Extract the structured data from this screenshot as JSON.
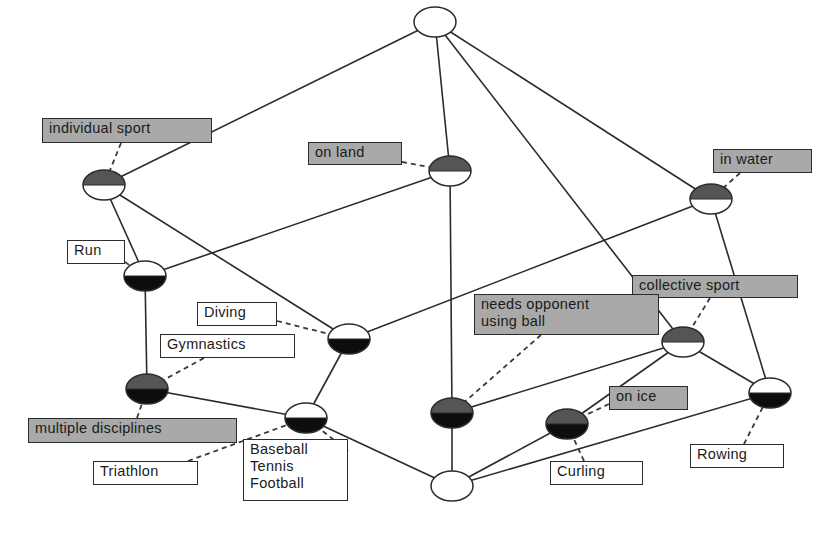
{
  "diagram": {
    "type": "concept-lattice",
    "colors": {
      "background": "#ffffff",
      "edge": "#2b2b2b",
      "attribute_fill": "#555555",
      "object_fill": "#0d0d0d",
      "attribute_label_bg": "#a9a9a9",
      "object_label_bg": "#ffffff"
    },
    "nodes": [
      {
        "id": "top",
        "x": 435,
        "y": 22,
        "top_filled": false,
        "bottom_filled": false
      },
      {
        "id": "individual-sport",
        "x": 104,
        "y": 185,
        "top_filled": true,
        "bottom_filled": false
      },
      {
        "id": "on-land",
        "x": 450,
        "y": 171,
        "top_filled": true,
        "bottom_filled": false
      },
      {
        "id": "in-water",
        "x": 711,
        "y": 199,
        "top_filled": true,
        "bottom_filled": false
      },
      {
        "id": "run",
        "x": 145,
        "y": 276,
        "top_filled": false,
        "bottom_filled": true
      },
      {
        "id": "diving",
        "x": 349,
        "y": 339,
        "top_filled": false,
        "bottom_filled": true
      },
      {
        "id": "multiple-disciplines",
        "x": 147,
        "y": 389,
        "top_filled": true,
        "bottom_filled": true
      },
      {
        "id": "baseball-tennis-football",
        "x": 306,
        "y": 418,
        "top_filled": false,
        "bottom_filled": true
      },
      {
        "id": "needs-opponent",
        "x": 452,
        "y": 413,
        "top_filled": true,
        "bottom_filled": true
      },
      {
        "id": "collective-sport",
        "x": 683,
        "y": 342,
        "top_filled": true,
        "bottom_filled": false
      },
      {
        "id": "on-ice",
        "x": 567,
        "y": 424,
        "top_filled": true,
        "bottom_filled": true
      },
      {
        "id": "rowing",
        "x": 770,
        "y": 393,
        "top_filled": false,
        "bottom_filled": true
      },
      {
        "id": "bottom",
        "x": 452,
        "y": 486,
        "top_filled": false,
        "bottom_filled": false
      }
    ],
    "edges": [
      [
        "top",
        "individual-sport"
      ],
      [
        "top",
        "on-land"
      ],
      [
        "top",
        "in-water"
      ],
      [
        "top",
        "collective-sport"
      ],
      [
        "individual-sport",
        "run"
      ],
      [
        "individual-sport",
        "diving"
      ],
      [
        "on-land",
        "run"
      ],
      [
        "on-land",
        "needs-opponent"
      ],
      [
        "in-water",
        "diving"
      ],
      [
        "in-water",
        "rowing"
      ],
      [
        "run",
        "multiple-disciplines"
      ],
      [
        "diving",
        "baseball-tennis-football"
      ],
      [
        "multiple-disciplines",
        "baseball-tennis-football"
      ],
      [
        "baseball-tennis-football",
        "bottom"
      ],
      [
        "needs-opponent",
        "bottom"
      ],
      [
        "collective-sport",
        "needs-opponent"
      ],
      [
        "collective-sport",
        "on-ice"
      ],
      [
        "collective-sport",
        "rowing"
      ],
      [
        "on-ice",
        "bottom"
      ],
      [
        "rowing",
        "bottom"
      ]
    ],
    "attribute_labels": [
      {
        "id": "lbl-individual-sport",
        "text": "individual sport",
        "x": 42,
        "y": 118,
        "w": 170,
        "h": 25,
        "node": "individual-sport",
        "anchor_x": 121,
        "anchor_y": 143
      },
      {
        "id": "lbl-on-land",
        "text": "on land",
        "x": 308,
        "y": 142,
        "w": 94,
        "h": 23,
        "node": "on-land",
        "anchor_x": 402,
        "anchor_y": 162
      },
      {
        "id": "lbl-in-water",
        "text": "in water",
        "x": 713,
        "y": 149,
        "w": 99,
        "h": 24,
        "node": "in-water",
        "anchor_x": 740,
        "anchor_y": 173
      },
      {
        "id": "lbl-collective-sport",
        "text": "collective sport",
        "x": 632,
        "y": 275,
        "w": 166,
        "h": 23,
        "node": "collective-sport",
        "anchor_x": 710,
        "anchor_y": 298
      },
      {
        "id": "lbl-needs-opponent",
        "text": "needs opponent\nusing ball",
        "x": 474,
        "y": 294,
        "w": 185,
        "h": 41,
        "node": "needs-opponent",
        "anchor_x": 541,
        "anchor_y": 335
      },
      {
        "id": "lbl-multiple-disciplines",
        "text": "multiple disciplines",
        "x": 28,
        "y": 418,
        "w": 209,
        "h": 25,
        "node": "multiple-disciplines",
        "anchor_x": 137,
        "anchor_y": 418
      },
      {
        "id": "lbl-on-ice",
        "text": "on ice",
        "x": 609,
        "y": 386,
        "w": 79,
        "h": 24,
        "node": "on-ice",
        "anchor_x": 609,
        "anchor_y": 404
      }
    ],
    "object_labels": [
      {
        "id": "lbl-run",
        "text": "Run",
        "x": 67,
        "y": 240,
        "w": 58,
        "h": 24,
        "node": "run",
        "anchor_x": 125,
        "anchor_y": 262
      },
      {
        "id": "lbl-diving",
        "text": "Diving",
        "x": 197,
        "y": 302,
        "w": 80,
        "h": 24,
        "node": "diving",
        "anchor_x": 277,
        "anchor_y": 321
      },
      {
        "id": "lbl-gymnastics",
        "text": "Gymnastics",
        "x": 160,
        "y": 334,
        "w": 135,
        "h": 24,
        "node": "multiple-disciplines",
        "anchor_x": 204,
        "anchor_y": 358
      },
      {
        "id": "lbl-triathlon",
        "text": "Triathlon",
        "x": 93,
        "y": 461,
        "w": 105,
        "h": 24,
        "node": "baseball-tennis-football",
        "anchor_x": 188,
        "anchor_y": 461
      },
      {
        "id": "lbl-baseball",
        "text": "Baseball\nTennis\nFootball",
        "x": 243,
        "y": 439,
        "w": 105,
        "h": 62,
        "node": "baseball-tennis-football",
        "anchor_x": 348,
        "anchor_y": 451
      },
      {
        "id": "lbl-curling",
        "text": "Curling",
        "x": 550,
        "y": 461,
        "w": 93,
        "h": 24,
        "node": "on-ice",
        "anchor_x": 584,
        "anchor_y": 461
      },
      {
        "id": "lbl-rowing",
        "text": "Rowing",
        "x": 690,
        "y": 444,
        "w": 94,
        "h": 24,
        "node": "rowing",
        "anchor_x": 744,
        "anchor_y": 444
      }
    ]
  }
}
